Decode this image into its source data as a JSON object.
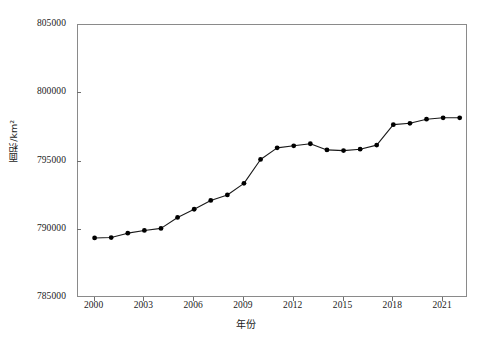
{
  "chart_data": {
    "type": "line",
    "title": "",
    "subtitle": "",
    "xlabel": "年份",
    "ylabel": "面积/km²",
    "xlim": [
      1999,
      2022.5
    ],
    "ylim": [
      785000,
      805000
    ],
    "grid": false,
    "legend": null,
    "annotations": [],
    "x_ticks": [
      2000,
      2003,
      2006,
      2009,
      2012,
      2015,
      2018,
      2021
    ],
    "x_tick_labels": [
      "2000",
      "2003",
      "2006",
      "2009",
      "2012",
      "2015",
      "2018",
      "2021"
    ],
    "y_ticks": [
      785000,
      790000,
      795000,
      800000,
      805000
    ],
    "y_tick_labels": [
      "785000",
      "790000",
      "795000",
      "800000",
      "805000"
    ],
    "marker": "filled-circle",
    "marker_color": "#000000",
    "line_color": "#1a1a1a",
    "x": [
      2000,
      2001,
      2002,
      2003,
      2004,
      2005,
      2006,
      2007,
      2008,
      2009,
      2010,
      2011,
      2012,
      2013,
      2014,
      2015,
      2016,
      2017,
      2018,
      2019,
      2020,
      2021,
      2022
    ],
    "series": [
      {
        "name": "面积",
        "values": [
          789400,
          789430,
          789750,
          789950,
          790100,
          790900,
          791500,
          792150,
          792550,
          793400,
          795150,
          796000,
          796150,
          796300,
          795850,
          795800,
          795900,
          796200,
          797700,
          797800,
          798100,
          798200,
          798200
        ]
      }
    ]
  },
  "axes": {
    "y_title": "面积/km²",
    "x_title": "年份"
  }
}
